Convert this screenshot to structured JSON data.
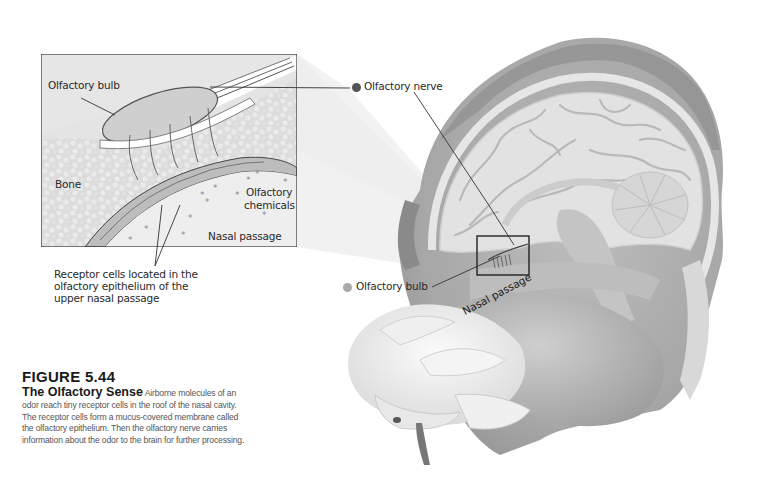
{
  "figure": {
    "number": "FIGURE 5.44",
    "title": "The Olfactory Sense",
    "caption": "Airborne molecules of an odor reach tiny receptor cells in the roof of the nasal cavity. The receptor cells form a mucus-covered membrane called the olfactory epithelium. Then the olfactory nerve carries information about the odor to the brain for further processing."
  },
  "inset": {
    "labels": {
      "olfactory_bulb": "Olfactory bulb",
      "bone": "Bone",
      "olfactory_chemicals_line1": "Olfactory",
      "olfactory_chemicals_line2": "chemicals",
      "nasal_passage": "Nasal passage"
    },
    "callout": {
      "line1": "Receptor cells located in the",
      "line2": "olfactory epithelium of the",
      "line3": "upper nasal passage"
    }
  },
  "head": {
    "labels": {
      "olfactory_nerve": "Olfactory nerve",
      "olfactory_bulb": "Olfactory bulb",
      "nasal_passage": "Nasal passage"
    }
  },
  "colors": {
    "nerve_dot": "#555555",
    "bulb_dot": "#a8a8a8",
    "inset_bg": "#e6e6e6",
    "line": "#333333"
  }
}
